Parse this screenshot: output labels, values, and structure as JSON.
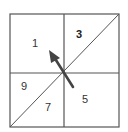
{
  "diagram": {
    "type": "grid-quadrant-diagram",
    "grid": {
      "rows": 2,
      "cols": 2,
      "has_diagonal": true,
      "diagonal_direction": "bottom-left to top-right"
    },
    "regions": [
      {
        "id": "top-left",
        "label": "1",
        "bold": false
      },
      {
        "id": "top-right-upper",
        "label": "3",
        "bold": true
      },
      {
        "id": "bottom-left-upper",
        "label": "9",
        "bold": false
      },
      {
        "id": "bottom-left-lower",
        "label": "7",
        "bold": false
      },
      {
        "id": "bottom-right",
        "label": "5",
        "bold": false
      }
    ],
    "arrow": {
      "direction": "up-left",
      "icon": "arrow-up-left-icon"
    },
    "colors": {
      "line": "#555555",
      "arrow": "#444444",
      "text": "#333333",
      "background": "#ffffff"
    }
  }
}
